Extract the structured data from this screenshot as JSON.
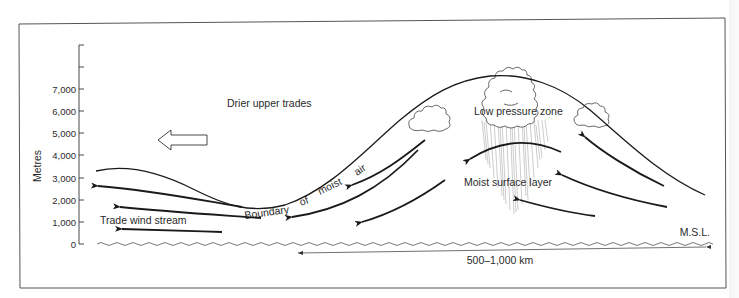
{
  "figure": {
    "type": "cross-section diagram"
  },
  "y_axis": {
    "label": "Metres",
    "ticks": [
      "0",
      "1,000",
      "2,000",
      "3,000",
      "4,000",
      "5,000",
      "6,000",
      "7,000"
    ]
  },
  "labels": {
    "drier_upper_trades": "Drier upper trades",
    "boundary": [
      "Boundary",
      "of",
      "moist",
      "air"
    ],
    "trade_wind_stream": "Trade wind stream",
    "low_pressure_zone": "Low pressure zone",
    "moist_surface_layer": "Moist surface layer",
    "msl": "M.S.L.",
    "distance": "500–1,000 km"
  },
  "colors": {
    "line": "#1a1a1a",
    "text": "#2a2a2a",
    "frame": "#555555",
    "rain": "#9a9a9a"
  }
}
